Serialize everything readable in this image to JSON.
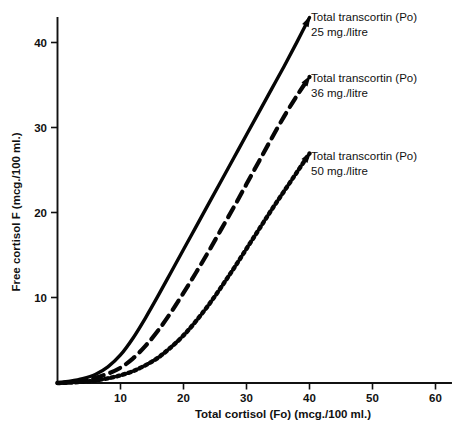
{
  "chart_data": {
    "type": "line",
    "title": "",
    "xlabel": "Total cortisol (Fo) (mcg./100 ml.)",
    "ylabel": "Free cortisol F (mcg./100 ml.)",
    "xlim": [
      0,
      62
    ],
    "ylim": [
      0,
      44
    ],
    "xticks": [
      10,
      20,
      30,
      40,
      50,
      60
    ],
    "yticks": [
      10,
      20,
      30,
      40
    ],
    "xtick_labels": [
      "10",
      "20",
      "30",
      "40",
      "50",
      "60"
    ],
    "ytick_labels": [
      "10",
      "20",
      "30",
      "40"
    ],
    "grid": false,
    "legend_position": "in-plot-right",
    "series": [
      {
        "name": "Total transcortin (Po) 25 mg./litre",
        "style": "solid",
        "label_line1": "Total transcortin (Po)",
        "label_line2": "25 mg./litre",
        "x": [
          0,
          2,
          4,
          6,
          8,
          10,
          12,
          14,
          16,
          18,
          20,
          22,
          24,
          26,
          28,
          30,
          32,
          34,
          36,
          38,
          40
        ],
        "y": [
          0,
          0.2,
          0.5,
          1.0,
          1.9,
          3.3,
          5.3,
          7.7,
          10.3,
          13.0,
          15.7,
          18.4,
          21.1,
          23.8,
          26.5,
          29.2,
          31.9,
          34.6,
          37.3,
          40.1,
          43.0
        ]
      },
      {
        "name": "Total transcortin (Po) 36 mg./litre",
        "style": "dashed",
        "label_line1": "Total transcortin (Po)",
        "label_line2": "36 mg./litre",
        "x": [
          0,
          2,
          4,
          6,
          8,
          10,
          12,
          14,
          16,
          18,
          20,
          22,
          24,
          26,
          28,
          30,
          32,
          34,
          36,
          38,
          40
        ],
        "y": [
          0,
          0.1,
          0.3,
          0.6,
          1.1,
          1.8,
          2.9,
          4.4,
          6.2,
          8.3,
          10.6,
          13.0,
          15.5,
          18.1,
          20.7,
          23.4,
          26.1,
          28.8,
          31.4,
          33.8,
          36.0
        ]
      },
      {
        "name": "Total transcortin (Po) 50 mg./litre",
        "style": "dotted",
        "label_line1": "Total transcortin (Po)",
        "label_line2": "50 mg./litre",
        "x": [
          0,
          2,
          4,
          6,
          8,
          10,
          12,
          14,
          16,
          18,
          20,
          22,
          24,
          26,
          28,
          30,
          32,
          34,
          36,
          38,
          40
        ],
        "y": [
          0,
          0.05,
          0.15,
          0.3,
          0.55,
          0.9,
          1.4,
          2.1,
          3.0,
          4.2,
          5.6,
          7.3,
          9.2,
          11.3,
          13.5,
          15.8,
          18.1,
          20.4,
          22.6,
          24.8,
          27.0
        ]
      }
    ]
  }
}
